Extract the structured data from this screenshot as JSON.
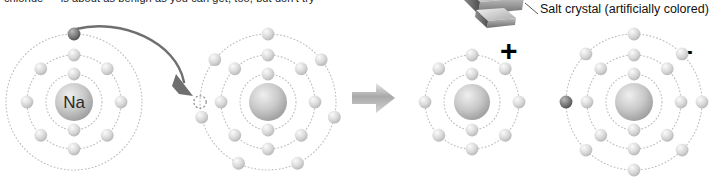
{
  "page": {
    "background": "#ffffff",
    "partial_caption_top": "chloride — is about as benign as you can get, too, but don't try"
  },
  "crystal": {
    "label": "Salt crystal (artificially colored)",
    "icon": "salt-crystal-cube-photo",
    "leader_line": "leader-line"
  },
  "signs": {
    "plus": "+",
    "minus": "–"
  },
  "reaction": {
    "arrow_icon": "block-arrow-right",
    "transfer_arrow_icon": "curved-electron-transfer-arrow"
  },
  "colors": {
    "electron_light": "#d8d8d8",
    "electron_dark": "#7a7a7a",
    "nucleus": "#c9c9c9",
    "shell": "#bdbdbd",
    "arrow": "#7d7d7d",
    "text": "#111111"
  },
  "diagrams": [
    {
      "id": "sodium-atom",
      "name": "Na",
      "nucleus_label": "Na",
      "charge": "",
      "shells": [
        {
          "index": 1,
          "radius": 28,
          "electrons": 2
        },
        {
          "index": 2,
          "radius": 47,
          "electrons": 8
        },
        {
          "index": 3,
          "radius": 68,
          "electrons": 1
        }
      ],
      "total_electrons": 11,
      "has_vacancy": false,
      "highlighted_electron": "outer-shell-top"
    },
    {
      "id": "chlorine-atom",
      "name": "Cl",
      "nucleus_label": "",
      "charge": "",
      "shells": [
        {
          "index": 1,
          "radius": 28,
          "electrons": 2
        },
        {
          "index": 2,
          "radius": 47,
          "electrons": 8
        },
        {
          "index": 3,
          "radius": 68,
          "electrons": 7
        }
      ],
      "total_electrons": 17,
      "has_vacancy": true,
      "vacancy_position": "outer-shell-left"
    },
    {
      "id": "sodium-ion",
      "name": "Na+",
      "nucleus_label": "",
      "charge": "+",
      "shells": [
        {
          "index": 1,
          "radius": 28,
          "electrons": 2
        },
        {
          "index": 2,
          "radius": 47,
          "electrons": 8
        }
      ],
      "total_electrons": 10,
      "has_vacancy": false
    },
    {
      "id": "chloride-ion",
      "name": "Cl-",
      "nucleus_label": "",
      "charge": "–",
      "shells": [
        {
          "index": 1,
          "radius": 28,
          "electrons": 2
        },
        {
          "index": 2,
          "radius": 47,
          "electrons": 8
        },
        {
          "index": 3,
          "radius": 68,
          "electrons": 8
        }
      ],
      "total_electrons": 18,
      "has_vacancy": false,
      "highlighted_electron": "outer-shell-left"
    }
  ]
}
